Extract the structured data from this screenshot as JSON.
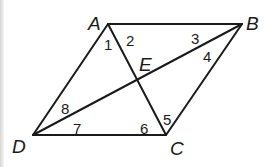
{
  "diagram": {
    "type": "parallelogram-with-diagonals",
    "vertices": [
      {
        "id": "A",
        "label": "A",
        "x": 108,
        "y": 24,
        "lx": 88,
        "ly": 30
      },
      {
        "id": "B",
        "label": "B",
        "x": 242,
        "y": 24,
        "lx": 246,
        "ly": 30
      },
      {
        "id": "C",
        "label": "C",
        "x": 166,
        "y": 135,
        "lx": 170,
        "ly": 155
      },
      {
        "id": "D",
        "label": "D",
        "x": 33,
        "y": 135,
        "lx": 12,
        "ly": 153
      }
    ],
    "intersection": {
      "id": "E",
      "label": "E",
      "x": 137,
      "y": 79,
      "lx": 139,
      "ly": 71
    },
    "segments": [
      [
        "A",
        "B"
      ],
      [
        "B",
        "C"
      ],
      [
        "C",
        "D"
      ],
      [
        "D",
        "A"
      ],
      [
        "A",
        "C"
      ],
      [
        "B",
        "D"
      ]
    ],
    "angles": [
      {
        "label": "1",
        "x": 104,
        "y": 50
      },
      {
        "label": "2",
        "x": 126,
        "y": 46
      },
      {
        "label": "3",
        "x": 191,
        "y": 44
      },
      {
        "label": "4",
        "x": 203,
        "y": 62
      },
      {
        "label": "5",
        "x": 163,
        "y": 125
      },
      {
        "label": "6",
        "x": 140,
        "y": 134
      },
      {
        "label": "7",
        "x": 73,
        "y": 134
      },
      {
        "label": "8",
        "x": 61,
        "y": 114
      }
    ]
  }
}
